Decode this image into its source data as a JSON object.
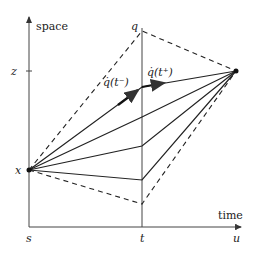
{
  "diagram": {
    "type": "space-time path diagram",
    "axes": {
      "y_label": "space",
      "x_label": "time",
      "x_ticks": [
        "s",
        "t",
        "u"
      ],
      "y_ticks": [
        "x",
        "z"
      ]
    },
    "labels": {
      "q_label": "q",
      "left_velocity": "q̇(t⁻)",
      "right_velocity": "q̇(t⁺)",
      "start_point": "x",
      "end_point_level": "z"
    },
    "paths": {
      "dashed_bounds": [
        "upper cone boundary via q",
        "lower cone boundary"
      ],
      "solid_paths": 4,
      "highlighted_path": "path with velocity arrows at t"
    },
    "colors": {
      "stroke": "#222222",
      "axis": "#444444",
      "background": "#ffffff"
    }
  }
}
